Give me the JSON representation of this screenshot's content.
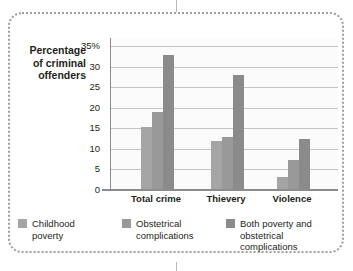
{
  "top_caption": "",
  "chart_data": {
    "type": "bar",
    "title": "",
    "xlabel": "",
    "ylabel": "Percentage of criminal offenders",
    "ylabel_lines": [
      "Percentage",
      "of criminal",
      "offenders"
    ],
    "ylim": [
      0,
      37
    ],
    "yticks": [
      0,
      5,
      10,
      15,
      20,
      25,
      30,
      35
    ],
    "ytick_labels": [
      "0",
      "5",
      "10",
      "15",
      "20",
      "25",
      "30",
      "35%"
    ],
    "grid": true,
    "legend_position": "bottom",
    "categories": [
      "Total crime",
      "Thievery",
      "Violence"
    ],
    "series": [
      {
        "name": "Childhood poverty",
        "name_lines": [
          "Childhood",
          "poverty"
        ],
        "color": "#a5a5a5",
        "values": [
          15.4,
          12.0,
          3.2
        ]
      },
      {
        "name": "Obstetrical complications",
        "name_lines": [
          "Obstetrical",
          "complications"
        ],
        "color": "#999999",
        "values": [
          19.0,
          13.0,
          7.2
        ]
      },
      {
        "name": "Both poverty and obstetrical complications",
        "name_lines": [
          "Both poverty and",
          "obstetrical complications"
        ],
        "color": "#8b8b8b",
        "values": [
          32.8,
          28.0,
          12.5
        ]
      }
    ]
  }
}
